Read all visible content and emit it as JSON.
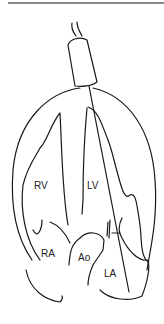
{
  "diagram": {
    "labels": {
      "rv": "RV",
      "lv": "LV",
      "ra": "RA",
      "ao": "Ao",
      "la": "LA"
    },
    "colors": {
      "stroke": "#1a1a1a",
      "background": "#ffffff",
      "top_rule": "#8a8a8a"
    }
  }
}
